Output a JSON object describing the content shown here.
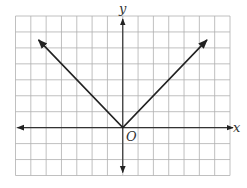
{
  "chart_data": {
    "type": "line",
    "title": "",
    "xlabel": "x",
    "ylabel": "y",
    "origin_label": "O",
    "grid": true,
    "grid_cols_left": 7,
    "grid_cols_right": 7,
    "grid_rows_above": 7,
    "grid_rows_below": 3,
    "xlim": [
      -7,
      7
    ],
    "ylim": [
      -3,
      7
    ],
    "series": [
      {
        "name": "y = |x|",
        "points": [
          [
            -5.5,
            5.5
          ],
          [
            0,
            0
          ],
          [
            5.5,
            5.5
          ]
        ],
        "arrows_at_ends": true
      }
    ],
    "colors": {
      "grid": "#b0b0b0",
      "axis": "#333333",
      "curve": "#222222"
    }
  }
}
